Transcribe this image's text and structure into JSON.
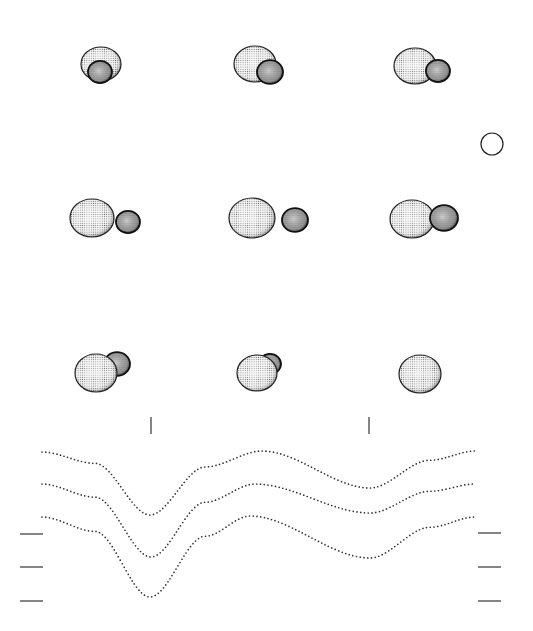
{
  "figure": {
    "background": "#ffffff",
    "ink": "#222222"
  },
  "phases_grid": {
    "rows": 3,
    "cols": 3,
    "frames": [
      {
        "cx": 101,
        "cy": 64,
        "primary": {
          "rx": 20,
          "ry": 17
        },
        "secondary": {
          "dx": -1,
          "dy": 8,
          "r": 12
        },
        "secondary_front": true
      },
      {
        "cx": 255,
        "cy": 64,
        "primary": {
          "rx": 21,
          "ry": 18
        },
        "secondary": {
          "dx": 15,
          "dy": 8,
          "r": 13
        },
        "secondary_front": true
      },
      {
        "cx": 415,
        "cy": 66,
        "primary": {
          "rx": 21,
          "ry": 18
        },
        "secondary": {
          "dx": 23,
          "dy": 5,
          "r": 12
        },
        "secondary_front": true
      },
      {
        "cx": 92,
        "cy": 218,
        "primary": {
          "rx": 22,
          "ry": 19
        },
        "secondary": {
          "dx": 36,
          "dy": 4,
          "r": 12
        },
        "secondary_front": true
      },
      {
        "cx": 252,
        "cy": 218,
        "primary": {
          "rx": 23,
          "ry": 20
        },
        "secondary": {
          "dx": 43,
          "dy": 2,
          "r": 13
        },
        "secondary_front": true
      },
      {
        "cx": 412,
        "cy": 219,
        "primary": {
          "rx": 22,
          "ry": 19
        },
        "secondary": {
          "dx": 32,
          "dy": -1,
          "r": 14
        },
        "secondary_front": true
      },
      {
        "cx": 96,
        "cy": 373,
        "primary": {
          "rx": 21,
          "ry": 19
        },
        "secondary": {
          "dx": 21,
          "dy": -9,
          "r": 13
        },
        "secondary_front": false
      },
      {
        "cx": 257,
        "cy": 373,
        "primary": {
          "rx": 20,
          "ry": 18
        },
        "secondary": {
          "dx": 13,
          "dy": -9,
          "r": 11
        },
        "secondary_front": false
      },
      {
        "cx": 420,
        "cy": 374,
        "primary": {
          "rx": 21,
          "ry": 19
        },
        "secondary": null,
        "secondary_front": false
      }
    ]
  },
  "legend_circle": {
    "cx": 492,
    "cy": 144,
    "r": 11
  },
  "phase_markers": [
    {
      "x": 151,
      "y1": 417,
      "y2": 434
    },
    {
      "x": 369,
      "y1": 417,
      "y2": 434
    }
  ],
  "chart_data": {
    "type": "line",
    "title": "",
    "xlabel": "",
    "ylabel": "",
    "x_pixel_range": [
      42,
      475
    ],
    "series": [
      {
        "name": "curve-1",
        "baseline": 451,
        "primary_min": {
          "x": 150,
          "y": 515
        },
        "max": {
          "x": 262,
          "y": 451
        },
        "secondary_min": {
          "x": 370,
          "y": 488
        },
        "end": 451,
        "start": 452
      },
      {
        "name": "curve-2",
        "baseline": 484,
        "primary_min": {
          "x": 151,
          "y": 557
        },
        "max": {
          "x": 255,
          "y": 484
        },
        "secondary_min": {
          "x": 370,
          "y": 513
        },
        "end": 484,
        "start": 484
      },
      {
        "name": "curve-3",
        "baseline": 517,
        "primary_min": {
          "x": 150,
          "y": 597
        },
        "max": {
          "x": 250,
          "y": 516
        },
        "secondary_min": {
          "x": 370,
          "y": 558
        },
        "end": 517,
        "start": 517
      }
    ],
    "left_ticks_y": [
      534,
      567,
      601
    ],
    "right_ticks_y": [
      533,
      567,
      601
    ],
    "grid": false,
    "legend": "none"
  }
}
